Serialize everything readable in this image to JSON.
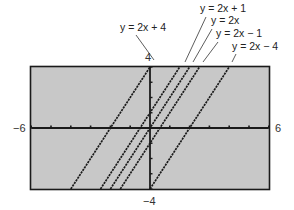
{
  "chart_data": {
    "type": "line",
    "title": "",
    "xlabel": "",
    "ylabel": "",
    "xlim": [
      -6,
      6
    ],
    "ylim": [
      -4,
      4
    ],
    "x_ticks_step": 1,
    "y_ticks_step": 1,
    "grid": false,
    "window_labels": {
      "xmin": "−6",
      "xmax": "6",
      "ymax": "4",
      "ymin": "−4"
    },
    "series": [
      {
        "name": "y = 2x + 4",
        "slope": 2,
        "intercept": 4,
        "x": [
          -4,
          0
        ],
        "y": [
          -4,
          4
        ]
      },
      {
        "name": "y = 2x + 1",
        "slope": 2,
        "intercept": 1,
        "x": [
          -2.5,
          1.5
        ],
        "y": [
          -4,
          4
        ]
      },
      {
        "name": "y = 2x",
        "slope": 2,
        "intercept": 0,
        "x": [
          -2,
          2
        ],
        "y": [
          -4,
          4
        ]
      },
      {
        "name": "y = 2x − 1",
        "slope": 2,
        "intercept": -1,
        "x": [
          -1.5,
          2.5
        ],
        "y": [
          -4,
          4
        ]
      },
      {
        "name": "y = 2x − 4",
        "slope": 2,
        "intercept": -4,
        "x": [
          0,
          4
        ],
        "y": [
          -4,
          4
        ]
      }
    ],
    "annotations": [
      {
        "text": "y = 2x + 4",
        "points_to": "y = 2x + 4"
      },
      {
        "text": "y = 2x + 1",
        "points_to": "y = 2x + 1"
      },
      {
        "text": "y = 2x",
        "points_to": "y = 2x"
      },
      {
        "text": "y = 2x − 1",
        "points_to": "y = 2x − 1"
      },
      {
        "text": "y = 2x − 4",
        "points_to": "y = 2x − 4"
      }
    ]
  },
  "colors": {
    "screen_bg": "#c8c8c8",
    "frame": "#1a1a1a",
    "plot_line": "#1a1a1a"
  }
}
